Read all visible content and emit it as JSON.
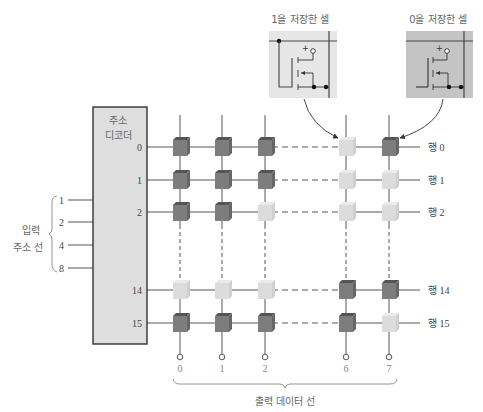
{
  "decoder": {
    "label_line1": "주소",
    "label_line2": "디코더"
  },
  "input_group_label_line1": "입력",
  "input_group_label_line2": "주소 선",
  "input_lines": [
    "1",
    "2",
    "4",
    "8"
  ],
  "decoder_outputs": [
    "0",
    "1",
    "2",
    "14",
    "15"
  ],
  "row_labels": [
    "행 0",
    "행 1",
    "행 2",
    "행 14",
    "행 15"
  ],
  "column_labels": [
    "0",
    "1",
    "2",
    "6",
    "7"
  ],
  "output_group_label": "출력 데이터 선",
  "callouts": {
    "cell_one": "1을 저장한 셀",
    "cell_zero": "0을 저장한 셀"
  },
  "colors": {
    "cell_one": "#7d7d7d",
    "cell_zero": "#dcdcdc",
    "decoder_fill": "#dedede",
    "callout_one_bg": "#e6e6e6",
    "callout_zero_bg": "#c4c4c4"
  },
  "cells": [
    [
      1,
      1,
      1,
      0,
      1
    ],
    [
      1,
      1,
      1,
      0,
      0
    ],
    [
      1,
      1,
      0,
      0,
      0
    ],
    [
      0,
      0,
      0,
      1,
      1
    ],
    [
      1,
      1,
      1,
      1,
      0
    ]
  ]
}
